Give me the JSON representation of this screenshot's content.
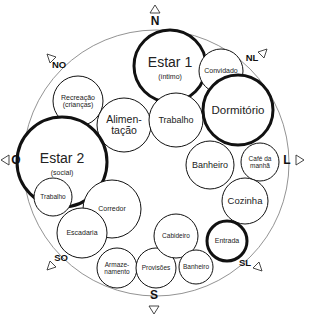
{
  "diagram": {
    "type": "bubble-adjacency-diagram",
    "outer_circle": {
      "cx": 156,
      "cy": 163,
      "r": 133,
      "stroke": "#777777"
    },
    "compass": [
      {
        "id": "N",
        "label": "N",
        "x": 155,
        "y": 25,
        "tri": "up",
        "tx": 155,
        "ty": 9
      },
      {
        "id": "NL",
        "label": "NL",
        "x": 252,
        "y": 61,
        "tri": "ne",
        "tx": 263,
        "ty": 53
      },
      {
        "id": "L",
        "label": "L",
        "x": 287,
        "y": 164,
        "tri": "right",
        "tx": 300,
        "ty": 160
      },
      {
        "id": "SL",
        "label": "SL",
        "x": 245,
        "y": 266,
        "tri": "se",
        "tx": 258,
        "ty": 267
      },
      {
        "id": "S",
        "label": "S",
        "x": 154,
        "y": 299,
        "tri": "down",
        "tx": 154,
        "ty": 310
      },
      {
        "id": "SO",
        "label": "SO",
        "x": 61,
        "y": 261,
        "tri": "sw",
        "tx": 51,
        "ty": 266
      },
      {
        "id": "O",
        "label": "O",
        "x": 16,
        "y": 164,
        "tri": "left",
        "tx": 5,
        "ty": 160
      },
      {
        "id": "NO",
        "label": "NO",
        "x": 59,
        "y": 68,
        "tri": "nw",
        "tx": 51,
        "ty": 58
      }
    ],
    "rooms": [
      {
        "id": "estar1",
        "lines": [
          "Estar 1"
        ],
        "sub": "(íntimo)",
        "cx": 170,
        "cy": 66,
        "r": 36,
        "thick": true,
        "fs": 14
      },
      {
        "id": "convidado",
        "lines": [
          "Convidado"
        ],
        "sub": "",
        "cx": 221,
        "cy": 71,
        "r": 22,
        "thick": false,
        "fs": 7
      },
      {
        "id": "recreacao",
        "lines": [
          "Recreação",
          "(crianças)"
        ],
        "sub": "",
        "cx": 78,
        "cy": 101,
        "r": 25,
        "thick": false,
        "fs": 7
      },
      {
        "id": "alimentacao",
        "lines": [
          "Alimen-",
          "tação"
        ],
        "sub": "",
        "cx": 124,
        "cy": 125,
        "r": 27,
        "thick": false,
        "fs": 10.5
      },
      {
        "id": "trabalho-norte",
        "lines": [
          "Trabalho"
        ],
        "sub": "",
        "cx": 176,
        "cy": 120,
        "r": 27,
        "thick": false,
        "fs": 9
      },
      {
        "id": "dormitorio",
        "lines": [
          "Dormitório"
        ],
        "sub": "",
        "cx": 238,
        "cy": 110,
        "r": 35,
        "thick": true,
        "fs": 11.5
      },
      {
        "id": "estar2",
        "lines": [
          "Estar 2"
        ],
        "sub": "(social)",
        "cx": 62,
        "cy": 162,
        "r": 45,
        "thick": true,
        "fs": 14
      },
      {
        "id": "banheiro-leste",
        "lines": [
          "Banheiro"
        ],
        "sub": "",
        "cx": 210,
        "cy": 165,
        "r": 24,
        "thick": false,
        "fs": 9
      },
      {
        "id": "cafe",
        "lines": [
          "Café da",
          "manhã"
        ],
        "sub": "",
        "cx": 260,
        "cy": 162,
        "r": 19,
        "thick": false,
        "fs": 6.5
      },
      {
        "id": "cozinha",
        "lines": [
          "Cozinha"
        ],
        "sub": "",
        "cx": 245,
        "cy": 201,
        "r": 23,
        "thick": false,
        "fs": 9.5
      },
      {
        "id": "trabalho-oeste",
        "lines": [
          "Trabalho"
        ],
        "sub": "",
        "cx": 53,
        "cy": 197,
        "r": 19,
        "thick": false,
        "fs": 6.5
      },
      {
        "id": "corredor",
        "lines": [
          "Corredor"
        ],
        "sub": "",
        "cx": 112,
        "cy": 209,
        "r": 29,
        "thick": false,
        "fs": 7
      },
      {
        "id": "escadaria",
        "lines": [
          "Escadaria"
        ],
        "sub": "",
        "cx": 82,
        "cy": 233,
        "r": 25,
        "thick": false,
        "fs": 7
      },
      {
        "id": "armazenamento",
        "lines": [
          "Armaze-",
          "namento"
        ],
        "sub": "",
        "cx": 117,
        "cy": 268,
        "r": 20,
        "thick": false,
        "fs": 6.5
      },
      {
        "id": "provisoes",
        "lines": [
          "Provisões"
        ],
        "sub": "",
        "cx": 156,
        "cy": 268,
        "r": 20,
        "thick": false,
        "fs": 6.5
      },
      {
        "id": "cabideiro",
        "lines": [
          "Cabideiro"
        ],
        "sub": "",
        "cx": 176,
        "cy": 236,
        "r": 22,
        "thick": false,
        "fs": 6.5
      },
      {
        "id": "banheiro-sul",
        "lines": [
          "Banheiro"
        ],
        "sub": "",
        "cx": 196,
        "cy": 267,
        "r": 17,
        "thick": false,
        "fs": 6.5
      },
      {
        "id": "entrada",
        "lines": [
          "Entrada"
        ],
        "sub": "",
        "cx": 227,
        "cy": 241,
        "r": 20,
        "thick": true,
        "fs": 7
      }
    ]
  }
}
